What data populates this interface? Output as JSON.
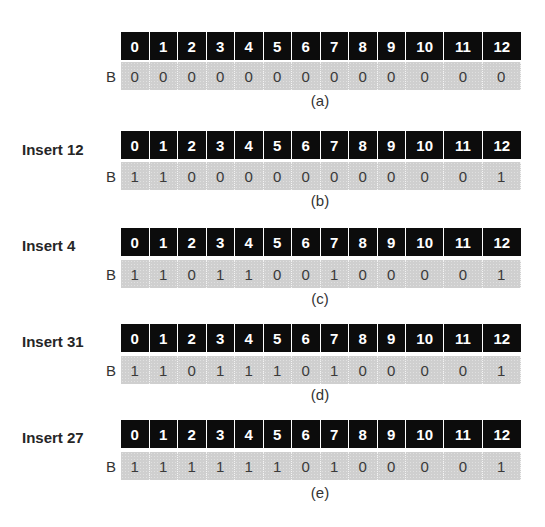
{
  "figure": {
    "header_indices": [
      "0",
      "1",
      "2",
      "3",
      "4",
      "5",
      "6",
      "7",
      "8",
      "9",
      "10",
      "11",
      "12"
    ],
    "row_label": "B",
    "colors": {
      "header_bg": "#0c0c0c",
      "header_text": "#ffffff",
      "value_bg": "#cfcfcf",
      "value_text": "#3a3a3a"
    },
    "steps": [
      {
        "label": "",
        "caption": "(a)",
        "bits": [
          "0",
          "0",
          "0",
          "0",
          "0",
          "0",
          "0",
          "0",
          "0",
          "0",
          "0",
          "0",
          "0"
        ]
      },
      {
        "label": "Insert 12",
        "caption": "(b)",
        "bits": [
          "1",
          "1",
          "0",
          "0",
          "0",
          "0",
          "0",
          "0",
          "0",
          "0",
          "0",
          "0",
          "1"
        ]
      },
      {
        "label": "Insert 4",
        "caption": "(c)",
        "bits": [
          "1",
          "1",
          "0",
          "1",
          "1",
          "0",
          "0",
          "1",
          "0",
          "0",
          "0",
          "0",
          "1"
        ]
      },
      {
        "label": "Insert 31",
        "caption": "(d)",
        "bits": [
          "1",
          "1",
          "0",
          "1",
          "1",
          "1",
          "0",
          "1",
          "0",
          "0",
          "0",
          "0",
          "1"
        ]
      },
      {
        "label": "Insert 27",
        "caption": "(e)",
        "bits": [
          "1",
          "1",
          "1",
          "1",
          "1",
          "1",
          "0",
          "1",
          "0",
          "0",
          "0",
          "0",
          "1"
        ]
      }
    ]
  }
}
